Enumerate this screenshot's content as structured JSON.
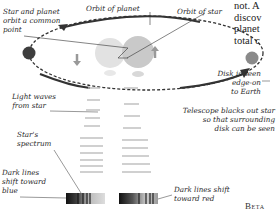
{
  "labels": {
    "common_point": [
      "Star and planet",
      "orbit a common",
      "point"
    ],
    "orbit_planet": "Orbit of planet",
    "orbit_star": "Orbit of star",
    "light_waves": [
      "Light waves",
      "from star"
    ],
    "spectrum": [
      "Star's",
      "spectrum"
    ],
    "blue_shift": [
      "Dark lines",
      "shift toward",
      "blue"
    ],
    "red_shift": [
      "Dark lines shift",
      "toward red"
    ],
    "disk_edge": [
      "Disk is seen",
      "edge-on",
      "to Earth"
    ],
    "telescope": [
      "Telescope blacks out star",
      "so that surrounding",
      "disk can be seen"
    ],
    "beta": "Beta"
  },
  "body_text": [
    "not. A",
    "discov",
    "planet",
    "total c"
  ],
  "colors": {
    "orbit_line": "#333333",
    "arrow": "#3a3a3a",
    "planet": "#4a4a4a",
    "star": "#d0d0d0",
    "wave": "#bdbdbd"
  }
}
